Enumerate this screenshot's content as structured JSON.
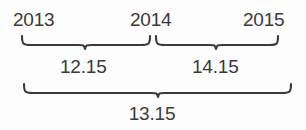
{
  "figure": {
    "type": "bracket-grouping-diagram",
    "background_color": "#fdfdfd",
    "stroke_color": "#3a3a3a",
    "text_color": "#3a3a3a"
  },
  "year_axis": {
    "labels": [
      {
        "text": "2013",
        "x": 13
      },
      {
        "text": "2014",
        "x": 130
      },
      {
        "text": "2015",
        "x": 243
      }
    ]
  },
  "braces": {
    "upper_left": {
      "label": "12.15",
      "spans": "2013-2014",
      "left": 22,
      "right": 150,
      "peak_x": 85,
      "top_y": 36,
      "bottom_y": 48
    },
    "upper_right": {
      "label": "14.15",
      "spans": "2014-2015",
      "left": 156,
      "right": 278,
      "peak_x": 216,
      "top_y": 36,
      "bottom_y": 48
    },
    "lower_total": {
      "label": "13.15",
      "spans": "2013-2015",
      "left": 24,
      "right": 291,
      "peak_x": 158,
      "top_y": 84,
      "bottom_y": 96
    }
  },
  "values": {
    "left_interval": "12.15",
    "right_interval": "14.15",
    "total_interval": "13.15"
  }
}
